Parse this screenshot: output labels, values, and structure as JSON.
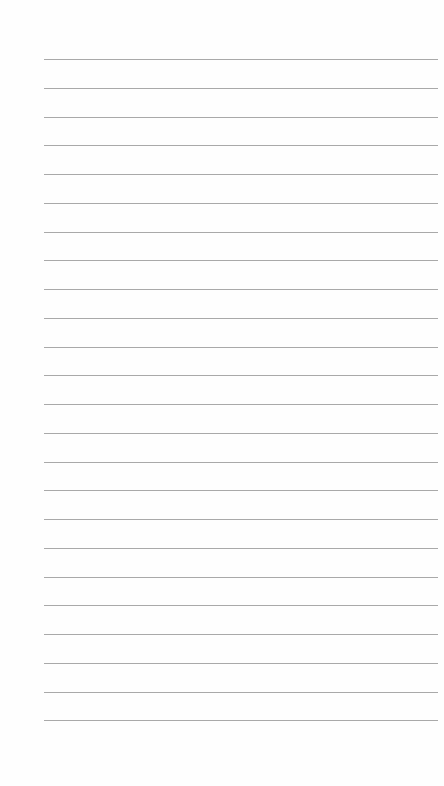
{
  "page": {
    "type": "lined-paper",
    "background_color": "#fefefe",
    "line_color": "#9a9a9a",
    "line_count": 24,
    "first_line_y": 59,
    "line_spacing": 28.75,
    "line_left": 44,
    "line_width": 394,
    "text": ""
  }
}
